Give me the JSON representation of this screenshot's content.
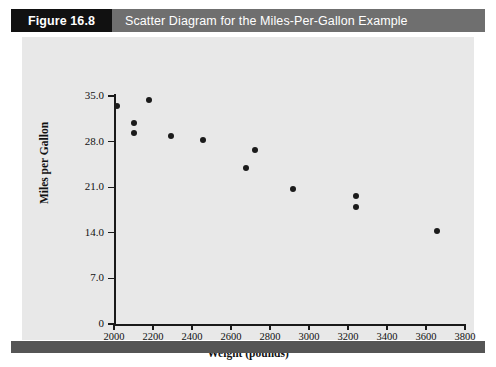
{
  "figure": {
    "number_label": "Figure 16.8",
    "caption": "Scatter Diagram for the Miles-Per-Gallon Example",
    "number_box_color": "#111111",
    "caption_box_color": "#6f6f6f",
    "panel_color": "#e8e8e8",
    "rule_color": "#555555"
  },
  "chart_data": {
    "type": "scatter",
    "title": "Scatter Diagram for the Miles-Per-Gallon Example",
    "xlabel": "Weight (pounds)",
    "ylabel": "Miles per Gallon",
    "xlim": [
      2000,
      3800
    ],
    "ylim": [
      0,
      35.0
    ],
    "grid": false,
    "legend": null,
    "marker_color": "#1b1b1b",
    "xticks": [
      2000,
      2200,
      2400,
      2600,
      2800,
      3000,
      3200,
      3400,
      3600,
      3800
    ],
    "xtick_labels": [
      "2000",
      "2200",
      "2400",
      "2600",
      "2800",
      "3000",
      "3200",
      "3400",
      "3600",
      "3800"
    ],
    "yticks": [
      0,
      7.0,
      14.0,
      21.0,
      28.0,
      35.0
    ],
    "ytick_labels": [
      "0",
      "7.0",
      "14.0",
      "21.0",
      "28.0",
      "35.0"
    ],
    "series": [
      {
        "name": "Automobiles",
        "x": [
          2016,
          2103,
          2103,
          2178,
          2292,
          2454,
          2676,
          2724,
          2919,
          3243,
          3243,
          3654
        ],
        "y": [
          33.4,
          30.8,
          29.3,
          34.4,
          28.8,
          28.2,
          24.0,
          26.7,
          20.8,
          19.6,
          18.0,
          14.2
        ]
      }
    ]
  }
}
